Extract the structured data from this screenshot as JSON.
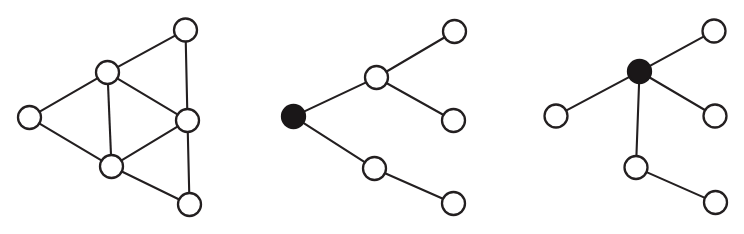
{
  "figure": {
    "background_color": "#ffffff",
    "node_stroke_color": "#231f20",
    "node_open_fill": "#ffffff",
    "node_filled_fill": "#1a1718",
    "edge_color": "#231f20",
    "edge_width": 2.1,
    "node_radius": 11.5,
    "canvas": {
      "width": 744,
      "height": 234
    }
  },
  "graphs": [
    {
      "id": "graph-left",
      "name": "triangular-lattice-graph",
      "node_count": 6,
      "edge_count": 9,
      "has_filled_node": false,
      "nodes": [
        {
          "id": "L0",
          "label": "left-vertex",
          "cx": 29.5,
          "cy": 117.5,
          "filled": false
        },
        {
          "id": "L1",
          "label": "upper-center-vertex",
          "cx": 107.5,
          "cy": 72.5,
          "filled": false
        },
        {
          "id": "L2",
          "label": "top-right-vertex",
          "cx": 185.5,
          "cy": 30.0,
          "filled": false
        },
        {
          "id": "L3",
          "label": "right-center-vertex",
          "cx": 187.5,
          "cy": 120.5,
          "filled": false
        },
        {
          "id": "L4",
          "label": "lower-center-vertex",
          "cx": 111.5,
          "cy": 166.5,
          "filled": false
        },
        {
          "id": "L5",
          "label": "bottom-right-vertex",
          "cx": 189.5,
          "cy": 204.5,
          "filled": false
        }
      ],
      "edges": [
        {
          "from": "L0",
          "to": "L1"
        },
        {
          "from": "L0",
          "to": "L4"
        },
        {
          "from": "L1",
          "to": "L2"
        },
        {
          "from": "L1",
          "to": "L3"
        },
        {
          "from": "L1",
          "to": "L4"
        },
        {
          "from": "L2",
          "to": "L3"
        },
        {
          "from": "L3",
          "to": "L4"
        },
        {
          "from": "L3",
          "to": "L5"
        },
        {
          "from": "L4",
          "to": "L5"
        }
      ]
    },
    {
      "id": "graph-middle",
      "name": "binary-branch-tree",
      "node_count": 6,
      "edge_count": 5,
      "has_filled_node": true,
      "nodes": [
        {
          "id": "M0",
          "label": "root-vertex-filled",
          "cx": 293.5,
          "cy": 116.5,
          "filled": true
        },
        {
          "id": "M1",
          "label": "upper-branch-vertex",
          "cx": 376.5,
          "cy": 77.5,
          "filled": false
        },
        {
          "id": "M2",
          "label": "upper-leaf-top",
          "cx": 454.5,
          "cy": 31.5,
          "filled": false
        },
        {
          "id": "M3",
          "label": "upper-leaf-bottom",
          "cx": 453.5,
          "cy": 120.5,
          "filled": false
        },
        {
          "id": "M4",
          "label": "lower-branch-vertex",
          "cx": 374.5,
          "cy": 168.5,
          "filled": false
        },
        {
          "id": "M5",
          "label": "lower-leaf",
          "cx": 453.5,
          "cy": 203.5,
          "filled": false
        }
      ],
      "edges": [
        {
          "from": "M0",
          "to": "M1"
        },
        {
          "from": "M0",
          "to": "M4"
        },
        {
          "from": "M1",
          "to": "M2"
        },
        {
          "from": "M1",
          "to": "M3"
        },
        {
          "from": "M4",
          "to": "M5"
        }
      ]
    },
    {
      "id": "graph-right",
      "name": "star-branch-tree",
      "node_count": 6,
      "edge_count": 5,
      "has_filled_node": true,
      "nodes": [
        {
          "id": "R0",
          "label": "hub-vertex-filled",
          "cx": 639.5,
          "cy": 71.5,
          "filled": true
        },
        {
          "id": "R1",
          "label": "upper-right-leaf",
          "cx": 714.0,
          "cy": 31.0,
          "filled": false
        },
        {
          "id": "R2",
          "label": "left-leaf",
          "cx": 556.0,
          "cy": 116.0,
          "filled": false
        },
        {
          "id": "R3",
          "label": "right-leaf",
          "cx": 715.0,
          "cy": 116.0,
          "filled": false
        },
        {
          "id": "R4",
          "label": "lower-branch-vertex",
          "cx": 636.0,
          "cy": 167.5,
          "filled": false
        },
        {
          "id": "R5",
          "label": "bottom-right-leaf",
          "cx": 715.5,
          "cy": 202.5,
          "filled": false
        }
      ],
      "edges": [
        {
          "from": "R0",
          "to": "R1"
        },
        {
          "from": "R0",
          "to": "R2"
        },
        {
          "from": "R0",
          "to": "R3"
        },
        {
          "from": "R0",
          "to": "R4"
        },
        {
          "from": "R4",
          "to": "R5"
        }
      ]
    }
  ]
}
